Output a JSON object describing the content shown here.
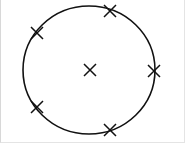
{
  "diagram": {
    "circle": {
      "cx": 89,
      "cy": 70,
      "rx": 66,
      "ry": 64,
      "stroke": "#111111"
    },
    "center_mark": {
      "x": 90,
      "y": 70
    },
    "circumference_marks": [
      {
        "x": 110,
        "y": 11
      },
      {
        "x": 37,
        "y": 33
      },
      {
        "x": 154,
        "y": 71
      },
      {
        "x": 37,
        "y": 107
      },
      {
        "x": 110,
        "y": 130
      }
    ],
    "mark_color": "#111111"
  }
}
